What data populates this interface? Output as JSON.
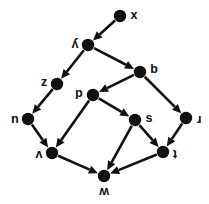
{
  "figure": {
    "kind": "directed-graph",
    "orientation_note": "labels drawn rotated 180 degrees",
    "background_color": "#ffffff",
    "ink_color": "#111111"
  },
  "graph_data": {
    "type": "diagram",
    "directed": true,
    "node_count": 11,
    "edge_count": 14,
    "nodes": [
      {
        "id": "x",
        "label": "x",
        "x": 120,
        "y": 16,
        "label_dx": 14,
        "label_dy": 0,
        "rotated": false
      },
      {
        "id": "y",
        "label": "y",
        "x": 88,
        "y": 45,
        "label_dx": -13,
        "label_dy": -1,
        "rotated": true
      },
      {
        "id": "b",
        "label": "b",
        "x": 140,
        "y": 72,
        "label_dx": 14,
        "label_dy": -2,
        "rotated": false
      },
      {
        "id": "z",
        "label": "z",
        "x": 57,
        "y": 84,
        "label_dx": -13,
        "label_dy": -1,
        "rotated": false
      },
      {
        "id": "d",
        "label": "d",
        "x": 93,
        "y": 95,
        "label_dx": -14,
        "label_dy": -2,
        "rotated": true
      },
      {
        "id": "u",
        "label": "u",
        "x": 28,
        "y": 119,
        "label_dx": -13,
        "label_dy": 0,
        "rotated": true
      },
      {
        "id": "s",
        "label": "s",
        "x": 135,
        "y": 120,
        "label_dx": 14,
        "label_dy": -1,
        "rotated": false
      },
      {
        "id": "r",
        "label": "r",
        "x": 186,
        "y": 118,
        "label_dx": 13,
        "label_dy": 1,
        "rotated": true
      },
      {
        "id": "v",
        "label": "v",
        "x": 52,
        "y": 153,
        "label_dx": -13,
        "label_dy": 1,
        "rotated": true
      },
      {
        "id": "t",
        "label": "t",
        "x": 163,
        "y": 152,
        "label_dx": 12,
        "label_dy": 1,
        "rotated": true
      },
      {
        "id": "w",
        "label": "w",
        "x": 104,
        "y": 176,
        "label_dx": 0,
        "label_dy": 15,
        "rotated": true
      }
    ],
    "edges": [
      {
        "from": "x",
        "to": "y"
      },
      {
        "from": "y",
        "to": "z"
      },
      {
        "from": "y",
        "to": "b"
      },
      {
        "from": "b",
        "to": "d"
      },
      {
        "from": "b",
        "to": "r"
      },
      {
        "from": "z",
        "to": "u"
      },
      {
        "from": "d",
        "to": "v"
      },
      {
        "from": "d",
        "to": "s"
      },
      {
        "from": "u",
        "to": "v"
      },
      {
        "from": "s",
        "to": "t"
      },
      {
        "from": "s",
        "to": "w"
      },
      {
        "from": "r",
        "to": "t"
      },
      {
        "from": "t",
        "to": "w"
      },
      {
        "from": "v",
        "to": "w"
      }
    ],
    "node_radius": 6.2,
    "arrow_length": 9,
    "arrow_half_width": 4.2
  }
}
